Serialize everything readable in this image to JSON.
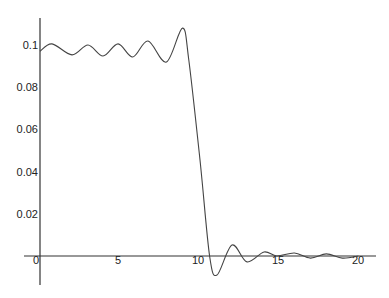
{
  "chart_data": {
    "type": "line",
    "title": "",
    "xlabel": "",
    "ylabel": "",
    "xlim": [
      0,
      21
    ],
    "ylim": [
      -0.01,
      0.11
    ],
    "grid": false,
    "legend": null,
    "x_ticks": [
      0,
      5,
      10,
      15,
      20
    ],
    "x_tick_labels": [
      "0",
      "5",
      "10",
      "15",
      "20"
    ],
    "y_ticks": [
      0.02,
      0.04,
      0.06,
      0.08,
      0.1
    ],
    "y_tick_labels": [
      "0.02",
      "0.04",
      "0.06",
      "0.08",
      "0.1"
    ],
    "series": [
      {
        "name": "curve",
        "color": "#444444",
        "x": [
          0,
          0.75,
          2.0,
          3.0,
          3.94,
          4.88,
          5.8,
          6.75,
          7.9,
          8.9,
          9.3,
          10.0,
          10.6,
          11.06,
          12.0,
          12.94,
          14.0,
          14.8,
          15.9,
          16.9,
          17.9,
          18.9,
          19.9
        ],
        "y": [
          0.097,
          0.1005,
          0.0953,
          0.1,
          0.0948,
          0.1005,
          0.0943,
          0.1019,
          0.0919,
          0.108,
          0.0929,
          0.0455,
          0.0,
          -0.009,
          0.0052,
          -0.0028,
          0.0019,
          0.0,
          0.0014,
          -0.001,
          0.001,
          -0.001,
          0.0
        ]
      }
    ]
  },
  "layout": {
    "origin_px": [
      40,
      256
    ],
    "px_per_x": 16,
    "px_per_y": 2110,
    "y_axis_top_px": 18,
    "y_axis_bottom_px": 285,
    "x_axis_left_px": 24,
    "x_axis_right_px": 376
  }
}
